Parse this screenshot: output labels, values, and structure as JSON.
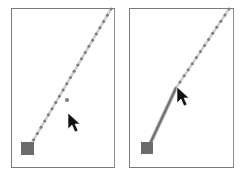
{
  "figure": {
    "colors": {
      "frame": "#7a7a7a",
      "guide_dot": "#8a8a8a",
      "guide_line": "#c8c8c8",
      "anchor_square": "#6b6b6b",
      "drawn_line": "#7f7f7f",
      "cursor": "#111111"
    }
  },
  "panels": [
    {
      "name": "before",
      "frame": {
        "x": 11,
        "y": 8,
        "w": 104,
        "h": 160
      },
      "anchor": {
        "x": 21,
        "y": 142,
        "size": 13
      },
      "guide": {
        "x1": 30,
        "y1": 146,
        "x2": 111,
        "y2": 9,
        "dots": 22
      },
      "stray_dot": {
        "x": 67,
        "y": 100
      },
      "cursor": {
        "x": 68,
        "y": 113
      }
    },
    {
      "name": "after",
      "frame": {
        "x": 129,
        "y": 8,
        "w": 105,
        "h": 160
      },
      "anchor": {
        "x": 141,
        "y": 142,
        "size": 12
      },
      "guide": {
        "x1": 176,
        "y1": 88,
        "x2": 229,
        "y2": 9,
        "dots": 13
      },
      "drawn": {
        "x1": 149,
        "y1": 146,
        "x2": 176,
        "y2": 88
      },
      "cursor": {
        "x": 178,
        "y": 88
      }
    }
  ]
}
